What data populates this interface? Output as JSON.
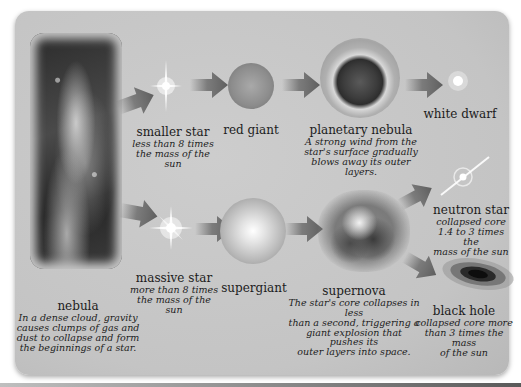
{
  "diagram": {
    "nodes": {
      "nebula": {
        "name": "nebula",
        "desc_lines": [
          "In a dense cloud, gravity",
          "causes clumps of gas and",
          "dust to collapse and form",
          "the beginnings of a star."
        ]
      },
      "smaller_star": {
        "name": "smaller star",
        "desc_lines": [
          "less than 8 times",
          "the mass of the sun"
        ]
      },
      "red_giant": {
        "name": "red giant"
      },
      "planetary_nebula": {
        "name": "planetary nebula",
        "desc_lines": [
          "A strong wind from the",
          "star's surface gradually",
          "blows away its outer layers."
        ]
      },
      "white_dwarf": {
        "name": "white dwarf"
      },
      "massive_star": {
        "name": "massive star",
        "desc_lines": [
          "more than 8 times",
          "the mass of the sun"
        ]
      },
      "supergiant": {
        "name": "supergiant"
      },
      "supernova": {
        "name": "supernova",
        "desc_lines": [
          "The star's core collapses in less",
          "than a second, triggering a",
          "giant explosion that pushes its",
          "outer layers into space."
        ]
      },
      "neutron_star": {
        "name": "neutron star",
        "desc_lines": [
          "collapsed core",
          "1.4 to 3 times the",
          "mass of the sun"
        ]
      },
      "black_hole": {
        "name": "black hole",
        "desc_lines": [
          "collapsed core more",
          "than 3 times the mass",
          "of the sun"
        ]
      }
    },
    "edges": [
      [
        "nebula",
        "smaller_star"
      ],
      [
        "smaller_star",
        "red_giant"
      ],
      [
        "red_giant",
        "planetary_nebula"
      ],
      [
        "planetary_nebula",
        "white_dwarf"
      ],
      [
        "nebula",
        "massive_star"
      ],
      [
        "massive_star",
        "supergiant"
      ],
      [
        "supergiant",
        "supernova"
      ],
      [
        "supernova",
        "neutron_star"
      ],
      [
        "supernova",
        "black_hole"
      ]
    ],
    "colors": {
      "panel_bg": "#c6c6c6",
      "arrow": "#6e6e6e",
      "text": "#1c1c1c"
    }
  }
}
